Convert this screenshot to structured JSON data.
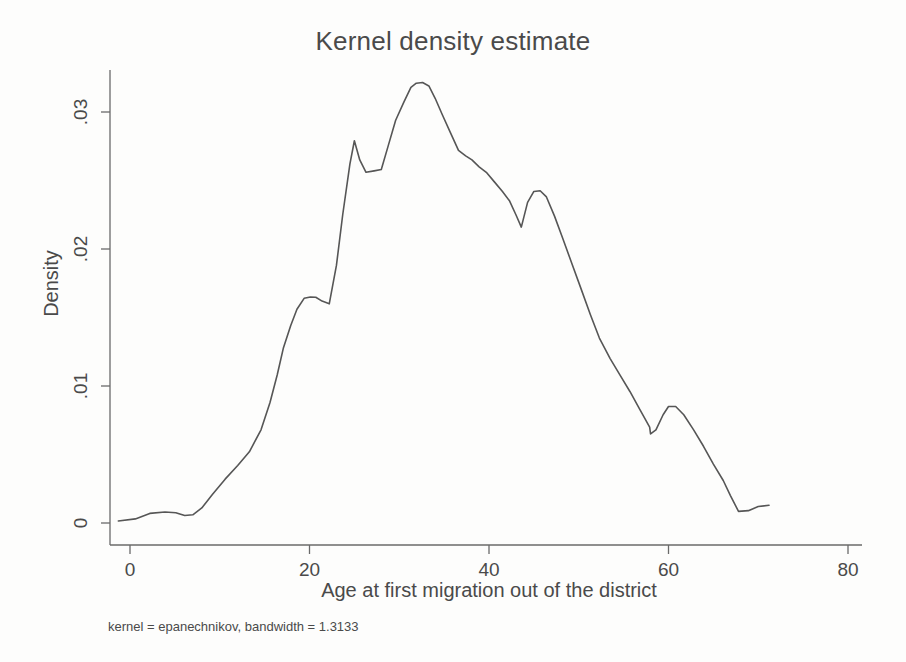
{
  "chart_data": {
    "type": "line",
    "title": "Kernel density estimate",
    "xlabel": "Age at first migration out of the district",
    "ylabel": "Density",
    "note": "kernel = epanechnikov, bandwidth = 1.3133",
    "grid": false,
    "legend": false,
    "xlim": [
      -2,
      80
    ],
    "ylim": [
      0,
      0.0335
    ],
    "xticks": [
      0,
      20,
      40,
      60,
      80
    ],
    "xtick_labels": [
      "0",
      "20",
      "40",
      "60",
      "80"
    ],
    "yticks": [
      0,
      0.01,
      0.02,
      0.03
    ],
    "ytick_labels": [
      "0",
      ".01",
      ".02",
      ".03"
    ],
    "series": [
      {
        "name": "Density",
        "x": [
          -1.3,
          0.6,
          2.2,
          3.9,
          5.1,
          6.1,
          7.0,
          8.0,
          9.2,
          10.6,
          12.0,
          13.3,
          14.6,
          15.6,
          16.4,
          17.1,
          17.9,
          18.6,
          19.4,
          20.1,
          20.7,
          21.4,
          22.2,
          23.0,
          23.7,
          24.5,
          25.0,
          25.6,
          26.3,
          27.2,
          28.0,
          28.8,
          29.6,
          30.5,
          31.3,
          31.9,
          32.6,
          33.3,
          34.0,
          34.8,
          35.7,
          36.6,
          37.4,
          38.1,
          38.9,
          39.7,
          40.6,
          41.5,
          42.3,
          43.0,
          43.6,
          44.3,
          45.0,
          45.7,
          46.4,
          47.3,
          48.2,
          49.2,
          50.2,
          51.3,
          52.3,
          53.5,
          54.6,
          55.7,
          56.8,
          57.9,
          58.0,
          58.6,
          59.4,
          60.0,
          60.8,
          61.7,
          62.8,
          63.9,
          65.0,
          66.1,
          66.9,
          67.8,
          68.9,
          70.0,
          71.2
        ],
        "y": [
          0.00015,
          0.0003,
          0.0007,
          0.0008,
          0.00075,
          0.00055,
          0.0006,
          0.0011,
          0.0021,
          0.0032,
          0.0042,
          0.0052,
          0.0068,
          0.0088,
          0.0108,
          0.0128,
          0.0144,
          0.0156,
          0.0164,
          0.0165,
          0.01648,
          0.0162,
          0.016,
          0.0188,
          0.0225,
          0.0262,
          0.0279,
          0.0265,
          0.0256,
          0.0257,
          0.0258,
          0.0276,
          0.0294,
          0.0307,
          0.0318,
          0.0321,
          0.03215,
          0.0319,
          0.031,
          0.0298,
          0.0285,
          0.0272,
          0.0268,
          0.0265,
          0.026,
          0.0256,
          0.0249,
          0.0242,
          0.0235,
          0.0225,
          0.0216,
          0.0234,
          0.0242,
          0.02425,
          0.0238,
          0.0224,
          0.0208,
          0.019,
          0.0172,
          0.0152,
          0.0135,
          0.012,
          0.0108,
          0.0096,
          0.0083,
          0.007,
          0.0065,
          0.0068,
          0.0079,
          0.0085,
          0.0085,
          0.0079,
          0.0068,
          0.0056,
          0.0043,
          0.0031,
          0.002,
          0.00085,
          0.0009,
          0.0012,
          0.0013
        ]
      }
    ]
  }
}
